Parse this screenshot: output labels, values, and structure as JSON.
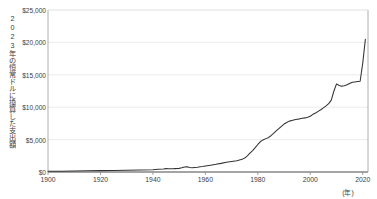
{
  "chart_data": {
    "type": "line",
    "title": "",
    "xlabel": "(年)",
    "ylabel": "2023年の恒常ドルに換算した支出額",
    "xlim": [
      1900,
      2022
    ],
    "ylim": [
      0,
      25000
    ],
    "grid": true,
    "legend": null,
    "y_tick_labels": [
      "$0",
      "$5,000",
      "$10,000",
      "$15,000",
      "$20,000",
      "$25,000"
    ],
    "y_ticks": [
      0,
      5000,
      10000,
      15000,
      20000,
      25000
    ],
    "x_tick_labels": [
      "1900",
      "1920",
      "1940",
      "1960",
      "1980",
      "2000",
      "2020"
    ],
    "x_ticks": [
      1900,
      1920,
      1940,
      1960,
      1980,
      2000,
      2020
    ],
    "line_color": "#333333",
    "grid_color": "#e6e6e6",
    "axis_color": "#555555",
    "series": [
      {
        "name": "支出額",
        "x": [
          1900,
          1905,
          1910,
          1915,
          1920,
          1925,
          1930,
          1935,
          1940,
          1942,
          1944,
          1945,
          1946,
          1948,
          1950,
          1951,
          1952,
          1953,
          1954,
          1955,
          1956,
          1957,
          1958,
          1959,
          1960,
          1962,
          1964,
          1966,
          1968,
          1970,
          1972,
          1974,
          1975,
          1976,
          1977,
          1978,
          1979,
          1980,
          1981,
          1982,
          1983,
          1984,
          1985,
          1986,
          1987,
          1988,
          1989,
          1990,
          1991,
          1992,
          1993,
          1994,
          1995,
          1996,
          1997,
          1998,
          1999,
          2000,
          2001,
          2002,
          2003,
          2004,
          2005,
          2006,
          2007,
          2008,
          2009,
          2010,
          2011,
          2012,
          2013,
          2014,
          2015,
          2016,
          2017,
          2018,
          2019,
          2020,
          2021
        ],
        "y": [
          110,
          130,
          155,
          180,
          210,
          245,
          280,
          310,
          360,
          420,
          470,
          520,
          500,
          520,
          560,
          640,
          760,
          820,
          700,
          660,
          700,
          740,
          800,
          860,
          930,
          1050,
          1180,
          1330,
          1500,
          1620,
          1750,
          1950,
          2150,
          2500,
          2900,
          3300,
          3750,
          4250,
          4700,
          4950,
          5150,
          5300,
          5600,
          5950,
          6350,
          6700,
          7050,
          7400,
          7650,
          7850,
          7950,
          8050,
          8150,
          8200,
          8300,
          8350,
          8450,
          8600,
          8900,
          9100,
          9350,
          9600,
          9900,
          10200,
          10550,
          11100,
          12500,
          13600,
          13350,
          13250,
          13300,
          13450,
          13650,
          13850,
          13900,
          13950,
          14000,
          16800,
          20500
        ],
        "units": "2023年恒常ドル"
      }
    ]
  },
  "corner": {
    "mark": ""
  }
}
